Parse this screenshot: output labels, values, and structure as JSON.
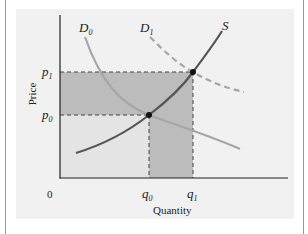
{
  "diagram": {
    "type": "supply-demand",
    "axes": {
      "x_label": "Quantity",
      "y_label": "Price",
      "origin_label": "0"
    },
    "curves": {
      "demand_initial": {
        "name": "D",
        "sub": "0",
        "style": "solid",
        "color": "#a6a6a6"
      },
      "demand_shifted": {
        "name": "D",
        "sub": "1",
        "style": "dashed",
        "color": "#a6a6a6"
      },
      "supply": {
        "name": "S",
        "style": "solid",
        "color": "#555555"
      }
    },
    "prices": [
      {
        "name": "p",
        "sub": "0"
      },
      {
        "name": "p",
        "sub": "1"
      }
    ],
    "quantities": [
      {
        "name": "q",
        "sub": "0"
      },
      {
        "name": "q",
        "sub": "1"
      }
    ],
    "equilibria": [
      {
        "label": "initial (q0, p0)"
      },
      {
        "label": "new (q1, p1)"
      }
    ],
    "colors": {
      "panel_background": "#f1f1f1",
      "light_region": "#e4e4e4",
      "dark_region": "#bcbcbc",
      "axis": "#222222"
    }
  }
}
